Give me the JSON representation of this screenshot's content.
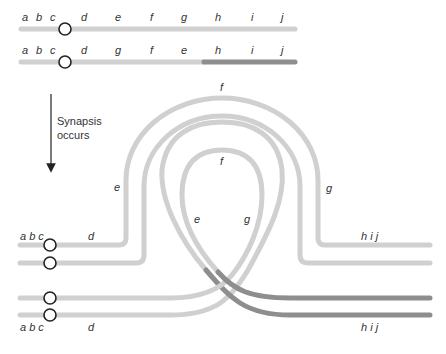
{
  "figure": {
    "top_chromosomes": [
      {
        "name": "normal",
        "labels": [
          "a",
          "b",
          "c",
          "d",
          "e",
          "f",
          "g",
          "h",
          "i",
          "j"
        ]
      },
      {
        "name": "inverted",
        "labels": [
          "a",
          "b",
          "c",
          "d",
          "g",
          "f",
          "e",
          "h",
          "i",
          "j"
        ]
      }
    ],
    "arrow_caption": {
      "line1": "Synapsis",
      "line2": "occurs"
    },
    "loop_labels": {
      "outer_top": "f",
      "outer_left": "e",
      "outer_right": "g",
      "inner_top": "f",
      "inner_left": "e",
      "inner_right": "g"
    },
    "bottom_labels": {
      "upper_left": "a b c",
      "upper_d": "d",
      "upper_right": "h i j",
      "lower_left": "a b c",
      "lower_d": "d",
      "lower_right": "h i j"
    },
    "colors": {
      "light_chromatid": "#d0d0d0",
      "dark_chromatid": "#8e8e8e",
      "centromere_stroke": "#222222",
      "text": "#333333"
    }
  }
}
